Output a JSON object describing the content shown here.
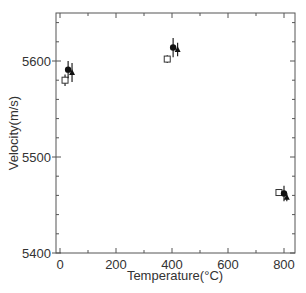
{
  "chart_data": {
    "type": "scatter",
    "title": "",
    "xlabel": "Temperature(°C)",
    "ylabel": "Velocity(m/s)",
    "xlim": [
      -20,
      840
    ],
    "ylim": [
      5400,
      5650
    ],
    "xticks": [
      0,
      200,
      400,
      600,
      800
    ],
    "yticks": [
      5400,
      5500,
      5600
    ],
    "grid": false,
    "legend": null,
    "series": [
      {
        "name": "open-square",
        "marker": "square-open",
        "points": [
          {
            "x": 18,
            "y": 5580,
            "err": 6
          },
          {
            "x": 383,
            "y": 5602,
            "err": 4
          },
          {
            "x": 782,
            "y": 5463,
            "err": 2
          }
        ]
      },
      {
        "name": "filled-circle",
        "marker": "circle-filled",
        "points": [
          {
            "x": 29,
            "y": 5591,
            "err": 9
          },
          {
            "x": 404,
            "y": 5614,
            "err": 10
          },
          {
            "x": 800,
            "y": 5462,
            "err": 8
          }
        ]
      },
      {
        "name": "filled-triangle",
        "marker": "triangle-filled",
        "points": [
          {
            "x": 43,
            "y": 5588,
            "err": 10
          },
          {
            "x": 420,
            "y": 5612,
            "err": 7
          },
          {
            "x": 810,
            "y": 5458,
            "err": 4
          }
        ]
      }
    ]
  },
  "axes": {
    "x_label": "Temperature(°C)",
    "y_label": "Velocity(m/s)",
    "x_tick_labels": [
      "0",
      "200",
      "400",
      "600",
      "800"
    ],
    "y_tick_labels": [
      "5400",
      "5500",
      "5600"
    ]
  }
}
